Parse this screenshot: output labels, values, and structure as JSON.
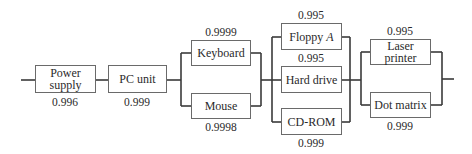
{
  "diagram": {
    "type": "reliability-block-diagram",
    "components": [
      {
        "id": "power",
        "label": "Power supply",
        "line1": "Power",
        "line2": "supply",
        "reliability": "0.996"
      },
      {
        "id": "pc",
        "label": "PC unit",
        "reliability": "0.999"
      },
      {
        "id": "keyboard",
        "label": "Keyboard",
        "reliability": "0.9999"
      },
      {
        "id": "mouse",
        "label": "Mouse",
        "reliability": "0.9998"
      },
      {
        "id": "floppy",
        "label": "Floppy",
        "label_italic": "A",
        "reliability": "0.995"
      },
      {
        "id": "harddrive",
        "label": "Hard drive",
        "reliability": "0.995"
      },
      {
        "id": "cdrom",
        "label": "CD-ROM",
        "reliability": "0.999"
      },
      {
        "id": "laser",
        "label": "Laser printer",
        "reliability": "0.995"
      },
      {
        "id": "dotmatrix",
        "label": "Dot matrix",
        "reliability": "0.999"
      }
    ],
    "colors": {
      "line": "#3a3a3a",
      "box_border": "#6a6a6a",
      "text": "#2a2a2a"
    }
  }
}
